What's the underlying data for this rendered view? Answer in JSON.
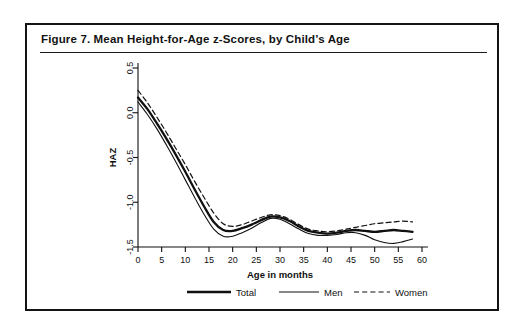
{
  "figure": {
    "title": "Figure 7.  Mean Height-for-Age z-Scores, by Child’s Age"
  },
  "chart_data": {
    "type": "line",
    "title": "Mean Height-for-Age z-Scores, by Child’s Age",
    "xlabel": "Age in months",
    "ylabel": "HAZ",
    "xlim": [
      0,
      60
    ],
    "ylim": [
      -1.5,
      0.5
    ],
    "xticks": [
      0,
      5,
      10,
      15,
      20,
      25,
      30,
      35,
      40,
      45,
      50,
      55,
      60
    ],
    "yticks": [
      0.5,
      0.0,
      -0.5,
      -1.0,
      -1.5
    ],
    "ytick_labels": [
      "0.5",
      "0.0",
      "-0.5",
      "-1.0",
      "-1.5"
    ],
    "xtick_labels": [
      "0",
      "5",
      "10",
      "15",
      "20",
      "25",
      "30",
      "35",
      "40",
      "45",
      "50",
      "55",
      "60"
    ],
    "grid": false,
    "legend_position": "bottom",
    "x": [
      0,
      2,
      4,
      6,
      8,
      10,
      12,
      14,
      16,
      18,
      20,
      22,
      24,
      26,
      28,
      30,
      32,
      34,
      36,
      38,
      40,
      42,
      44,
      46,
      48,
      50,
      52,
      54,
      56,
      58
    ],
    "series": [
      {
        "name": "Total",
        "style": "solid-thick",
        "values": [
          0.17,
          0.04,
          -0.12,
          -0.29,
          -0.47,
          -0.66,
          -0.86,
          -1.05,
          -1.22,
          -1.31,
          -1.32,
          -1.29,
          -1.25,
          -1.2,
          -1.16,
          -1.17,
          -1.21,
          -1.27,
          -1.32,
          -1.34,
          -1.35,
          -1.34,
          -1.32,
          -1.31,
          -1.32,
          -1.33,
          -1.32,
          -1.31,
          -1.32,
          -1.33
        ]
      },
      {
        "name": "Men",
        "style": "solid-thin",
        "values": [
          0.12,
          -0.02,
          -0.18,
          -0.36,
          -0.55,
          -0.75,
          -0.95,
          -1.14,
          -1.3,
          -1.38,
          -1.38,
          -1.34,
          -1.29,
          -1.23,
          -1.18,
          -1.19,
          -1.24,
          -1.3,
          -1.35,
          -1.37,
          -1.37,
          -1.36,
          -1.34,
          -1.34,
          -1.37,
          -1.42,
          -1.45,
          -1.46,
          -1.44,
          -1.41
        ]
      },
      {
        "name": "Women",
        "style": "dashed",
        "values": [
          0.25,
          0.11,
          -0.05,
          -0.22,
          -0.4,
          -0.58,
          -0.77,
          -0.95,
          -1.12,
          -1.24,
          -1.27,
          -1.25,
          -1.21,
          -1.17,
          -1.14,
          -1.15,
          -1.19,
          -1.25,
          -1.3,
          -1.32,
          -1.33,
          -1.32,
          -1.3,
          -1.28,
          -1.26,
          -1.24,
          -1.23,
          -1.22,
          -1.21,
          -1.22
        ]
      }
    ]
  },
  "legend": {
    "items": [
      {
        "label": "Total",
        "style": "solid-thick"
      },
      {
        "label": "Men",
        "style": "solid-thin"
      },
      {
        "label": "Women",
        "style": "dashed"
      }
    ]
  },
  "colors": {
    "ink": "#101010",
    "border": "#141414",
    "background": "#ffffff"
  }
}
